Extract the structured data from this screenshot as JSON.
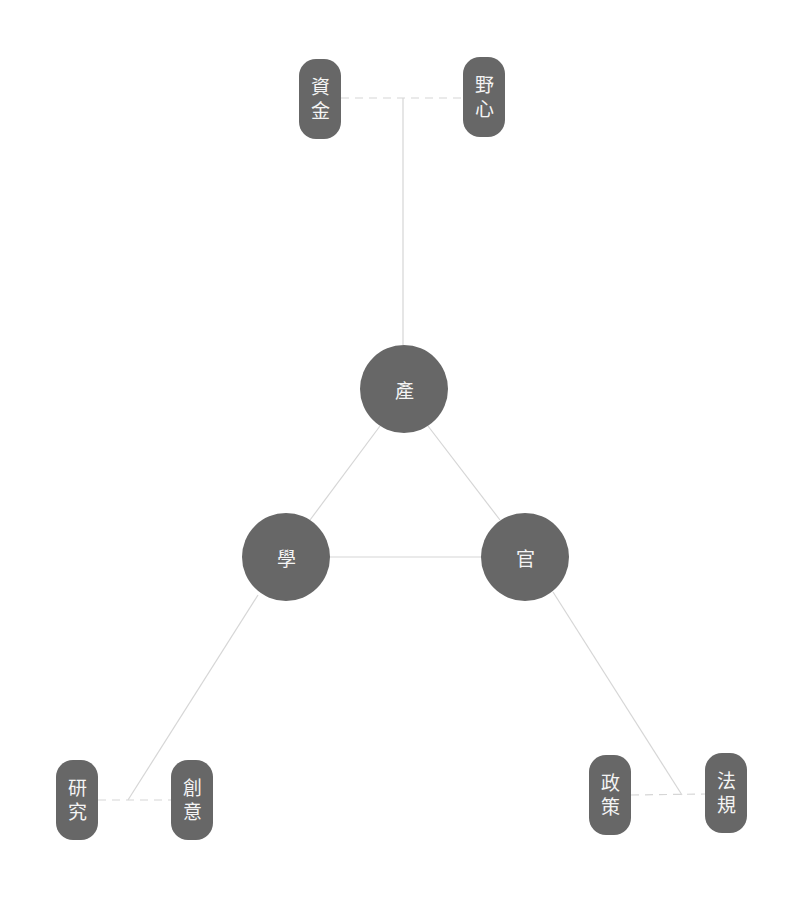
{
  "diagram": {
    "colors": {
      "node_fill": "#676767",
      "node_text": "#f4f4f4",
      "link": "#d6d6d6",
      "background": "#ffffff"
    },
    "hubs": [
      {
        "id": "industry",
        "label": "產",
        "x": 404,
        "y": 389
      },
      {
        "id": "academia",
        "label": "學",
        "x": 286,
        "y": 557
      },
      {
        "id": "government",
        "label": "官",
        "x": 525,
        "y": 557
      }
    ],
    "leaves": [
      {
        "id": "funding",
        "label": "資金",
        "chars": [
          "資",
          "金"
        ],
        "x": 320,
        "y": 99,
        "parent": "industry"
      },
      {
        "id": "ambition",
        "label": "野心",
        "chars": [
          "野",
          "心"
        ],
        "x": 484,
        "y": 97,
        "parent": "industry"
      },
      {
        "id": "research",
        "label": "研究",
        "chars": [
          "研",
          "究"
        ],
        "x": 77,
        "y": 800,
        "parent": "academia"
      },
      {
        "id": "creativity",
        "label": "創意",
        "chars": [
          "創",
          "意"
        ],
        "x": 192,
        "y": 800,
        "parent": "academia"
      },
      {
        "id": "policy",
        "label": "政策",
        "chars": [
          "政",
          "策"
        ],
        "x": 610,
        "y": 795,
        "parent": "government"
      },
      {
        "id": "regulation",
        "label": "法規",
        "chars": [
          "法",
          "規"
        ],
        "x": 726,
        "y": 793,
        "parent": "government"
      }
    ],
    "links": {
      "solid": [
        {
          "from": "industry",
          "to": "academia",
          "x1": 380,
          "y1": 426,
          "x2": 310,
          "y2": 520
        },
        {
          "from": "industry",
          "to": "government",
          "x1": 428,
          "y1": 426,
          "x2": 500,
          "y2": 520
        },
        {
          "from": "academia",
          "to": "government",
          "x1": 330,
          "y1": 557,
          "x2": 482,
          "y2": 557
        },
        {
          "from": "industry",
          "to": "top-branch",
          "x1": 403,
          "y1": 345,
          "x2": 403,
          "y2": 98
        },
        {
          "from": "academia",
          "to": "bottom-left-branch",
          "x1": 258,
          "y1": 595,
          "x2": 128,
          "y2": 800
        },
        {
          "from": "government",
          "to": "bottom-right-branch",
          "x1": 553,
          "y1": 592,
          "x2": 682,
          "y2": 795
        }
      ],
      "dashed": [
        {
          "between": [
            "funding",
            "ambition"
          ],
          "x1": 341,
          "y1": 98,
          "x2": 463,
          "y2": 98
        },
        {
          "between": [
            "research",
            "creativity"
          ],
          "x1": 98,
          "y1": 800,
          "x2": 171,
          "y2": 800
        },
        {
          "between": [
            "policy",
            "regulation"
          ],
          "x1": 631,
          "y1": 795,
          "x2": 705,
          "y2": 794
        }
      ]
    }
  }
}
